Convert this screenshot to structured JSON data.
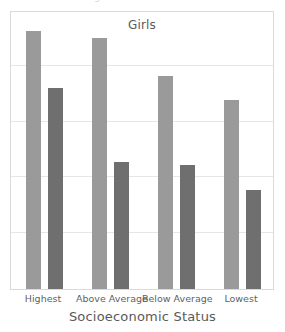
{
  "clipped_header_text": "Chart Percentage",
  "colors": {
    "series_light": "#9a9a9a",
    "series_dark": "#6f6f6f",
    "frame": "#dadada",
    "gridline": "#e6e6e6",
    "text": "#5a5a5a",
    "background": "#ffffff"
  },
  "chart_data": {
    "type": "bar",
    "title": "Girls",
    "xlabel": "Socioeconomic Status",
    "ylabel": "",
    "categories": [
      "Highest",
      "Above Average",
      "Below Average",
      "Lowest"
    ],
    "series": [
      {
        "name": "series-1",
        "color": "#9a9a9a",
        "values": [
          4.63,
          4.49,
          3.81,
          3.39
        ]
      },
      {
        "name": "series-2",
        "color": "#6f6f6f",
        "values": [
          3.6,
          2.28,
          2.23,
          1.77
        ]
      }
    ],
    "ylim": [
      0,
      5
    ],
    "y_gridline_values": [
      1,
      2,
      3,
      4
    ],
    "grid": true,
    "legend": false,
    "tick_labels_y": []
  }
}
